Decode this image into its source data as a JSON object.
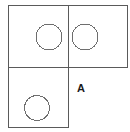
{
  "figure": {
    "background_color": "#ffffff",
    "line_color": "#5a5a5a",
    "circle_color": "#6e6e6e",
    "label_color": "#1a1a1a",
    "line_width": 1,
    "circle_line_width": 1,
    "canvas": {
      "width": 130,
      "height": 132
    }
  },
  "labels": [
    {
      "name": "label-a",
      "text": "A",
      "x": 81,
      "y": 89
    }
  ],
  "chart_data": {
    "type": "diagram",
    "squares": [
      {
        "name": "top-left-square",
        "x": 8,
        "y": 5,
        "width": 60,
        "height": 62
      },
      {
        "name": "top-right-square",
        "x": 68,
        "y": 5,
        "width": 59,
        "height": 62
      },
      {
        "name": "bottom-left-square",
        "x": 8,
        "y": 67,
        "width": 60,
        "height": 60
      }
    ],
    "circles": [
      {
        "name": "top-left-circle",
        "cx": 49,
        "cy": 37,
        "r": 13
      },
      {
        "name": "top-right-circle",
        "cx": 85,
        "cy": 37,
        "r": 13
      },
      {
        "name": "bottom-left-circle",
        "cx": 37,
        "cy": 108,
        "r": 12.5
      }
    ],
    "annotations": [
      "A"
    ]
  }
}
